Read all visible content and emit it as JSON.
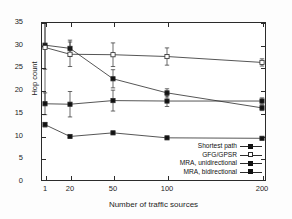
{
  "chart_data": {
    "type": "line",
    "title": "",
    "xlabel": "Number of traffic sources",
    "ylabel": "Hop count",
    "x": [
      1,
      20,
      50,
      100,
      200
    ],
    "xtick_labels": [
      "1",
      "20",
      "50",
      "100",
      "200"
    ],
    "ytick_labels": [
      "0",
      "5",
      "10",
      "15",
      "20",
      "25",
      "30",
      "35"
    ],
    "ylim": [
      0,
      35
    ],
    "ytick_step": 5,
    "grid": false,
    "legend_position": "lower-right-inside",
    "error_bars": true,
    "series": [
      {
        "name": "Shortest path",
        "marker": "filled-square",
        "values": [
          29.9,
          29.2,
          22.5,
          19.4,
          16.1
        ],
        "err_low": [
          5.3,
          1.8,
          2.0,
          0.9,
          0.6
        ],
        "err_high": [
          5.3,
          1.8,
          2.0,
          0.9,
          0.6
        ]
      },
      {
        "name": "GFG/GPSR",
        "marker": "open-square",
        "values": [
          29.4,
          27.9,
          27.8,
          27.4,
          26.1
        ],
        "err_low": [
          12.0,
          2.7,
          2.6,
          1.9,
          0.8
        ],
        "err_high": [
          9.0,
          2.7,
          2.6,
          1.9,
          0.8
        ]
      },
      {
        "name": "MRA, unidirectional",
        "marker": "filled-square",
        "values": [
          17.0,
          16.9,
          17.7,
          17.6,
          17.6
        ],
        "err_low": [
          2.4,
          2.8,
          2.3,
          1.2,
          0.7
        ],
        "err_high": [
          2.4,
          2.8,
          2.3,
          1.2,
          0.7
        ]
      },
      {
        "name": "MRA, bidirectional",
        "marker": "filled-square",
        "values": [
          12.4,
          9.8,
          10.6,
          9.5,
          9.4
        ],
        "err_low": [
          0.5,
          0.3,
          0.3,
          0.2,
          0.2
        ],
        "err_high": [
          0.5,
          0.3,
          0.3,
          0.2,
          0.2
        ]
      }
    ]
  },
  "axes": {
    "y_title": "Hop count",
    "x_title": "Number of traffic sources",
    "y_ticks": [
      "35",
      "30",
      "25",
      "20",
      "15",
      "10",
      "5",
      "0"
    ],
    "x_ticks": [
      "1",
      "20",
      "50",
      "100",
      "200"
    ]
  },
  "legend": {
    "items": [
      {
        "label": "Shortest path"
      },
      {
        "label": "GFG/GPSR"
      },
      {
        "label": "MRA, unidirectional"
      },
      {
        "label": "MRA, bidirectional"
      }
    ]
  },
  "colors": {
    "ink": "#1d1d1d",
    "axis": "#2b2b2b",
    "background": "#ffffff"
  }
}
